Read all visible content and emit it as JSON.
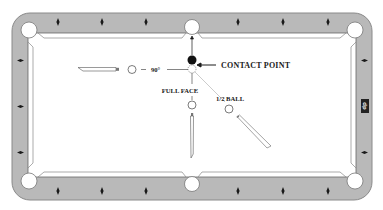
{
  "diagram": {
    "labels": {
      "contact_point": "CONTACT POINT",
      "angle": "90°",
      "full_face": "FULL FACE",
      "half_ball": "1/2 BALL"
    },
    "rail_badge": "dp",
    "colors": {
      "rail": "#b9b9b9",
      "rail_edge": "#8a8a8a",
      "cloth": "#ffffff",
      "pocket": "#ffffff",
      "ink": "#1a1a1a",
      "object_ball": "#111111",
      "aim_line": "#9a9a9a"
    },
    "elements": {
      "object_ball": "solid black object ball",
      "ghost_ball": "dashed ghost cue ball at contact",
      "shots": [
        {
          "name": "90-degree-shot",
          "label_key": "angle"
        },
        {
          "name": "full-face-shot",
          "label_key": "full_face"
        },
        {
          "name": "half-ball-shot",
          "label_key": "half_ball"
        }
      ]
    }
  }
}
